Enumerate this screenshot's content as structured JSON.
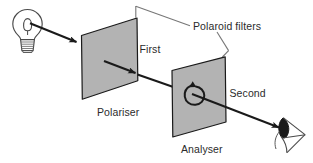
{
  "figure": {
    "width": 313,
    "height": 163,
    "background_color": "#ffffff"
  },
  "labels": {
    "polaroid_filters": "Polaroid filters",
    "first": "First",
    "second": "Second",
    "polariser": "Polariser",
    "analyser": "Analyser"
  },
  "components": {
    "light_source": {
      "name": "light-bulb",
      "description": "incandescent bulb with filament and screw base"
    },
    "polariser_panel": {
      "name": "polariser-panel",
      "fill_color": "#b3b3b3",
      "stroke_color": "#1a1a1a"
    },
    "analyser_panel": {
      "name": "analyser-panel",
      "fill_color": "#b3b3b3",
      "stroke_color": "#1a1a1a"
    },
    "rotation_arrow": {
      "name": "rotation-arrow",
      "description": "circular arrow indicating analyser rotation"
    },
    "eye": {
      "name": "observer-eye",
      "description": "eye of observer receiving transmitted light"
    },
    "beam": {
      "name": "light-beam",
      "stroke_color": "#1a1a1a",
      "description": "light ray travelling from bulb through polariser and analyser to the eye"
    },
    "bracket": {
      "name": "polaroid-filters-bracket",
      "stroke_color": "#6e6e6e"
    }
  },
  "colors": {
    "panel_fill": "#b3b3b3",
    "ink": "#1a1a1a",
    "text": "#2b2b2b",
    "bracket": "#777777"
  }
}
